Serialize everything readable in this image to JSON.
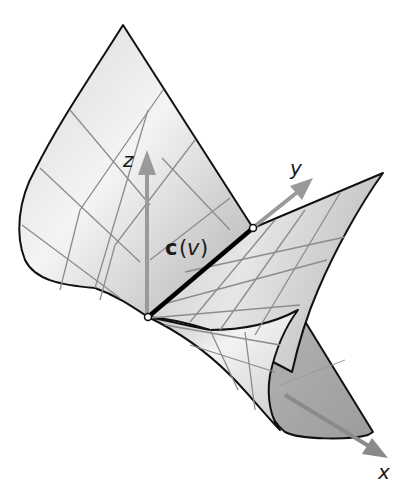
{
  "figure": {
    "labels": {
      "z_axis": "z",
      "y_axis": "y",
      "x_axis": "x",
      "curve_bold": "c",
      "curve_paren_open": "(",
      "curve_param": "v",
      "curve_paren_close": ")"
    },
    "colors": {
      "surface_light": "#f2f2f2",
      "surface_mid": "#c8c8c8",
      "surface_dark": "#9a9a9a",
      "underside": "#a6a6a6",
      "grid": "#8c8c8c",
      "edge": "#111111",
      "axis": "#9a9a9a",
      "curve": "#000000"
    }
  }
}
